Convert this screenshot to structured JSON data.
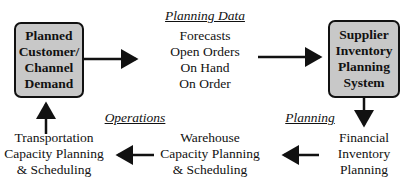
{
  "nodes": {
    "demand": {
      "lines": [
        "Planned",
        "Customer/",
        "Channel",
        "Demand"
      ]
    },
    "supplier": {
      "lines": [
        "Supplier",
        "Inventory",
        "Planning",
        "System"
      ]
    },
    "financial": {
      "lines": [
        "Financial",
        "Inventory",
        "Planning"
      ]
    },
    "warehouse": {
      "lines": [
        "Warehouse",
        "Capacity Planning",
        "& Scheduling"
      ]
    },
    "transportation": {
      "lines": [
        "Transportation",
        "Capacity Planning",
        "& Scheduling"
      ]
    }
  },
  "planning_data": {
    "heading": "Planning Data",
    "items": [
      "Forecasts",
      "Open Orders",
      "On Hand",
      "On Order"
    ]
  },
  "labels": {
    "planning": "Planning",
    "operations": "Operations"
  },
  "colors": {
    "box_fill": "#c8c8c8",
    "stroke": "#111111"
  }
}
